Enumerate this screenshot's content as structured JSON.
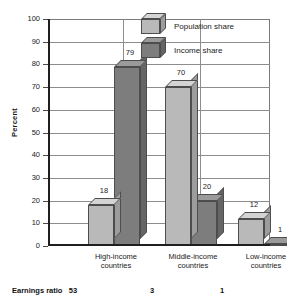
{
  "chart_data": {
    "type": "bar",
    "title": "",
    "xlabel": "",
    "ylabel": "Percent",
    "ylim": [
      0,
      100
    ],
    "ytick_labels": [
      "100",
      "90",
      "80",
      "70",
      "60",
      "50",
      "40",
      "30",
      "20",
      "10",
      "0"
    ],
    "ytick_values": [
      100,
      90,
      80,
      70,
      60,
      50,
      40,
      30,
      20,
      10,
      0
    ],
    "grid": true,
    "legend_position": "top-center",
    "categories": [
      "High-income countries",
      "Middle-income countries",
      "Low-income countries"
    ],
    "category_lines": [
      [
        "High-income",
        "countries"
      ],
      [
        "Middle-income",
        "countries"
      ],
      [
        "Low-income",
        "countries"
      ]
    ],
    "series": [
      {
        "name": "Population share",
        "color": "#b9b9b9",
        "values": [
          18,
          70,
          12
        ],
        "labels": [
          "18",
          "70",
          "12"
        ]
      },
      {
        "name": "Income share",
        "color": "#7d7d7d",
        "values": [
          79,
          20,
          1
        ],
        "labels": [
          "79",
          "20",
          "1"
        ]
      }
    ],
    "annotations": {
      "footer_label": "Earnings ratio",
      "footer_values": [
        "53",
        "3",
        "1"
      ]
    }
  },
  "legend": {
    "items": [
      {
        "label": "Population share",
        "swatch": "light"
      },
      {
        "label": "Income share",
        "swatch": "dark"
      }
    ]
  },
  "colors": {
    "light_front": "#b9b9b9",
    "light_top": "#d4d4d4",
    "light_side": "#9d9d9d",
    "dark_front": "#7d7d7d",
    "dark_top": "#9a9a9a",
    "dark_side": "#656565",
    "axis": "#1f1f1f",
    "grid": "#8d8d8d",
    "text": "#1a1a1a"
  }
}
